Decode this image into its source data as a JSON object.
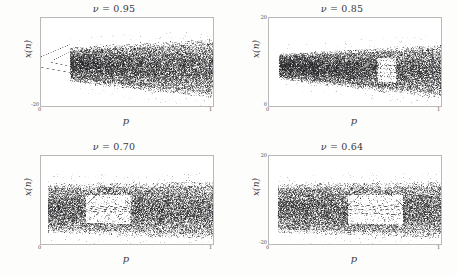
{
  "figure": {
    "name": "bifurcation-diagram-grid",
    "background": "#fdfdfc",
    "ink": "#2b2b2b"
  },
  "chart_data": [
    {
      "type": "scatter",
      "title": "ν = 0.95",
      "nu_symbol": "ν",
      "nu_value": "0.95",
      "title_rhs": "= 0.95",
      "xlabel": "p",
      "ylabel": "x(n)",
      "xlim": [
        0,
        1
      ],
      "ylim": [
        -20,
        20
      ],
      "xticks": [
        "0",
        "1"
      ],
      "yticks": [
        "",
        "-20"
      ],
      "ytick_top": "",
      "ytick_bottom": "-20",
      "xtick_left": "0",
      "xtick_right": "1",
      "grid": false,
      "legend": "none",
      "seed": 11,
      "band": {
        "period_end": 0.17,
        "upper_start": 0.42,
        "upper_end": 0.86,
        "lower_start": 0.22,
        "lower_end": -0.72,
        "density": 0.92,
        "center": 0.46
      },
      "branches": [
        {
          "x0": 0.0,
          "x1": 0.17,
          "y0": 0.56,
          "y1": 0.62
        },
        {
          "x0": 0.0,
          "x1": 0.17,
          "y0": 0.44,
          "y1": 0.3
        },
        {
          "x0": 0.05,
          "x1": 0.17,
          "y0": 0.5,
          "y1": 0.55
        },
        {
          "x0": 0.07,
          "x1": 0.17,
          "y0": 0.48,
          "y1": 0.38
        }
      ],
      "notes": "Strongly widening chaotic band; narrow period-2/4 window at left edge opening into fully developed chaos."
    },
    {
      "type": "scatter",
      "title": "ν = 0.85",
      "nu_symbol": "ν",
      "nu_value": "0.85",
      "title_rhs": "= 0.85",
      "xlabel": "p",
      "ylabel": "x(n)",
      "xlim": [
        0,
        1
      ],
      "ylim": [
        0,
        20
      ],
      "xticks": [
        "0",
        "1"
      ],
      "yticks": [
        "20",
        "0"
      ],
      "ytick_top": "20",
      "ytick_bottom": "0",
      "xtick_left": "0",
      "xtick_right": "1",
      "grid": false,
      "legend": "none",
      "seed": 23,
      "band": {
        "period_end": 0.06,
        "upper_start": 0.34,
        "upper_end": 0.78,
        "lower_start": 0.66,
        "lower_end": -0.4,
        "density": 0.95,
        "center": 0.5
      },
      "windows": [
        {
          "x0": 0.63,
          "x1": 0.74,
          "bands": [
            0.4,
            0.48,
            0.56,
            0.64
          ]
        }
      ],
      "notes": "Near-uniform chaotic band widening slowly; vertical periodic window with 3-4 thin bands near p=0.65-0.74."
    },
    {
      "type": "scatter",
      "title": "ν = 0.70",
      "nu_symbol": "ν",
      "nu_value": "0.70",
      "title_rhs": "= 0.70",
      "xlabel": "p",
      "ylabel": "x(n)",
      "xlim": [
        0,
        1
      ],
      "ylim": [
        -20,
        20
      ],
      "xticks": [
        "0",
        "1"
      ],
      "yticks": [
        "",
        ""
      ],
      "ytick_top": "",
      "ytick_bottom": "",
      "xtick_left": "0",
      "xtick_right": "1",
      "grid": false,
      "legend": "none",
      "seed": 37,
      "band": {
        "period_end": 0.04,
        "upper_start": 0.7,
        "upper_end": 0.84,
        "lower_start": 0.3,
        "lower_end": -0.1,
        "density": 0.93,
        "center": 0.5
      },
      "windows": [
        {
          "x0": 0.26,
          "x1": 0.52,
          "bands": [
            0.46,
            0.5,
            0.54
          ]
        }
      ],
      "notes": "Wide chaotic band interrupted by a large periodic window around p=0.26-0.52 containing looping curves, then chaos resumes abruptly."
    },
    {
      "type": "scatter",
      "title": "ν = 0.64",
      "nu_symbol": "ν",
      "nu_value": "0.64",
      "title_rhs": "= 0.64",
      "xlabel": "p",
      "ylabel": "x(n)",
      "xlim": [
        0,
        1
      ],
      "ylim": [
        -20,
        20
      ],
      "xticks": [
        "0",
        "1"
      ],
      "yticks": [
        "20",
        "-20"
      ],
      "ytick_top": "20",
      "ytick_bottom": "-20",
      "xtick_left": "0",
      "xtick_right": "1",
      "grid": false,
      "legend": "none",
      "seed": 53,
      "band": {
        "period_end": 0.05,
        "upper_start": 0.7,
        "upper_end": 0.82,
        "lower_start": 0.32,
        "lower_end": -0.06,
        "density": 0.9,
        "center": 0.5
      },
      "windows": [
        {
          "x0": 0.46,
          "x1": 0.78,
          "bands": [
            0.44,
            0.5,
            0.58
          ]
        }
      ],
      "notes": "Similar to nu=0.70 but with a broad light periodic corridor spanning p=0.46-0.78 and a sweeping upper branch."
    }
  ]
}
